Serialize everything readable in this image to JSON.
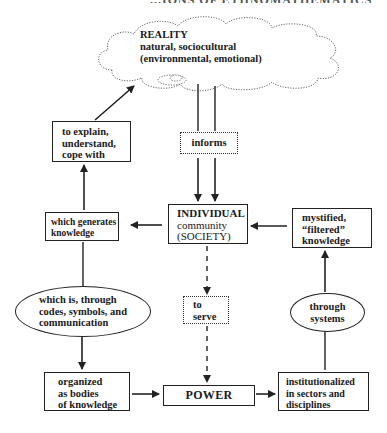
{
  "header": {
    "partial_title": "...IONS OF ETHNOMATHEMATICS"
  },
  "cloud": {
    "title": "REALITY",
    "lines": [
      "natural, sociocultural",
      "(environmental, emotional)"
    ]
  },
  "nodes": {
    "explain": {
      "lines": [
        "to explain,",
        "understand,",
        "cope with"
      ]
    },
    "informs": {
      "label": "informs"
    },
    "individual": {
      "lines": [
        "INDIVIDUAL",
        "community",
        "(SOCIETY)"
      ]
    },
    "generates": {
      "lines": [
        "which generates",
        "knowledge"
      ]
    },
    "mystified": {
      "lines": [
        "mystified,",
        "“filtered”",
        "knowledge"
      ]
    },
    "which_is": {
      "lines": [
        "which is, through",
        "codes, symbols, and",
        "communication"
      ]
    },
    "to_serve": {
      "lines": [
        "to",
        "serve"
      ]
    },
    "through_systems": {
      "lines": [
        "through",
        "systems"
      ]
    },
    "organized": {
      "lines": [
        "organized",
        "as bodies",
        "of knowledge"
      ]
    },
    "power": {
      "label": "POWER"
    },
    "institutionalized": {
      "lines": [
        "institutionalized",
        "in sectors and",
        "disciplines"
      ]
    }
  },
  "colors": {
    "ink": "#222222",
    "background": "#ffffff"
  }
}
